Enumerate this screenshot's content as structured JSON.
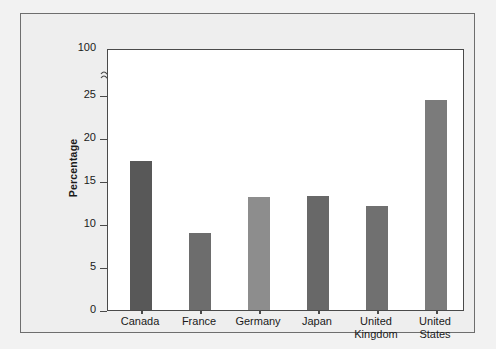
{
  "figure": {
    "background_color": "#eeeeee",
    "plot_background_color": "#ffffff",
    "frame_color": "#6e6e6e",
    "axis_color": "#4a4a4a",
    "axis_break_symbol": "≈"
  },
  "chart_data": {
    "type": "bar",
    "title": "",
    "subtitle": "",
    "xlabel": "",
    "ylabel": "Percentage",
    "categories": [
      "Canada",
      "France",
      "Germany",
      "Japan",
      "United Kingdom",
      "United States"
    ],
    "category_labels_wrapped": [
      "Canada",
      "France",
      "Germany",
      "Japan",
      "United\nKingdom",
      "United\nStates"
    ],
    "values": [
      17.4,
      9.0,
      13.2,
      13.3,
      12.2,
      24.5
    ],
    "bar_colors": [
      "#585858",
      "#6d6d6d",
      "#8d8d8d",
      "#686868",
      "#707070",
      "#7b7b7b"
    ],
    "ylim": [
      0,
      100
    ],
    "y_axis_broken": true,
    "y_break_between": [
      25,
      100
    ],
    "yticks": [
      0,
      5,
      10,
      15,
      20,
      25,
      100
    ],
    "ytick_labels": [
      "0",
      "5",
      "10",
      "15",
      "20",
      "25",
      "100"
    ],
    "grid": false,
    "legend": null,
    "legend_position": "none"
  },
  "axis_pixel_map": {
    "y0_px": 262,
    "y25_px": 47,
    "y100_px": 0,
    "px_per_unit_lower": 8.56
  },
  "bars": [
    {
      "label": "Canada",
      "value": 17.4,
      "color": "#585858",
      "left_px": 22,
      "width_px": 22
    },
    {
      "label": "France",
      "value": 9.0,
      "color": "#6d6d6d",
      "left_px": 81,
      "width_px": 22
    },
    {
      "label": "Germany",
      "value": 13.2,
      "color": "#8d8d8d",
      "left_px": 140,
      "width_px": 22
    },
    {
      "label": "Japan",
      "value": 13.3,
      "color": "#686868",
      "left_px": 199,
      "width_px": 22
    },
    {
      "label": "United Kingdom",
      "value": 12.2,
      "color": "#707070",
      "left_px": 258,
      "width_px": 22
    },
    {
      "label": "United States",
      "value": 24.5,
      "color": "#7b7b7b",
      "left_px": 317,
      "width_px": 22
    }
  ],
  "yticks_layout": [
    {
      "label": "100",
      "top_px": 0,
      "no_mark": true
    },
    {
      "label": "25",
      "top_px": 47,
      "no_mark": false
    },
    {
      "label": "20",
      "top_px": 90,
      "no_mark": false
    },
    {
      "label": "15",
      "top_px": 133,
      "no_mark": false
    },
    {
      "label": "10",
      "top_px": 176,
      "no_mark": false
    },
    {
      "label": "5",
      "top_px": 219,
      "no_mark": false
    },
    {
      "label": "0",
      "top_px": 262,
      "no_mark": false
    }
  ]
}
